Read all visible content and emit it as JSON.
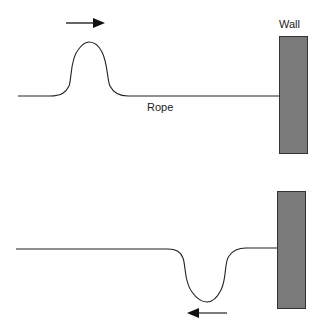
{
  "diagram": {
    "labels": {
      "wall": "Wall",
      "rope": "Rope"
    },
    "panels": [
      {
        "name": "incident-pulse",
        "pulse": "upright crest",
        "direction": "right"
      },
      {
        "name": "reflected-pulse",
        "pulse": "inverted trough",
        "direction": "left"
      }
    ],
    "colors": {
      "wall_fill": "#7a7a7a",
      "wall_border": "#333333",
      "rope": "#222222"
    }
  }
}
